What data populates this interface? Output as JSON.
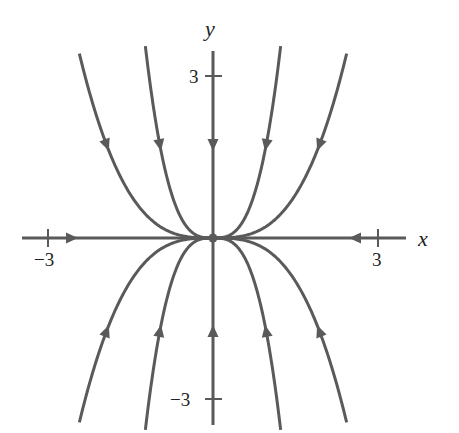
{
  "chart_data": {
    "type": "line",
    "title": "",
    "subtitle": "Phase portrait: trajectories approaching the origin (stable node)",
    "xlabel": "x",
    "ylabel": "y",
    "xlim": [
      -3.8,
      3.5
    ],
    "ylim": [
      -3.45,
      3.46
    ],
    "grid": false,
    "legend": null,
    "x_ticks": [
      {
        "value": -3,
        "label": "−3"
      },
      {
        "value": 3,
        "label": "3"
      }
    ],
    "y_ticks": [
      {
        "value": 3,
        "label": "3"
      },
      {
        "value": -3,
        "label": "−3"
      }
    ],
    "equilibrium": {
      "x": 0,
      "y": 0,
      "label": "origin",
      "kind": "stable node"
    },
    "curve_family": "y = C x^3",
    "series": [
      {
        "name": "curve C=0.238 (upper-right)",
        "C": 0.238,
        "x_range": [
          0,
          2.43
        ],
        "direction": "toward origin"
      },
      {
        "name": "curve C=1.91 (upper-right inner)",
        "C": 1.91,
        "x_range": [
          0,
          1.23
        ],
        "direction": "toward origin"
      },
      {
        "name": "curve C=-0.238 (upper-left)",
        "C": -0.238,
        "x_range": [
          -2.43,
          0
        ],
        "direction": "toward origin"
      },
      {
        "name": "curve C=-1.91 (upper-left inner)",
        "C": -1.91,
        "x_range": [
          -1.23,
          0
        ],
        "direction": "toward origin"
      },
      {
        "name": "curve C=0.238 (lower-left)",
        "C": 0.238,
        "x_range": [
          -2.43,
          0
        ],
        "direction": "toward origin"
      },
      {
        "name": "curve C=1.91 (lower-left inner)",
        "C": 1.91,
        "x_range": [
          -1.23,
          0
        ],
        "direction": "toward origin"
      },
      {
        "name": "curve C=-0.238 (lower-right)",
        "C": -0.238,
        "x_range": [
          0,
          2.43
        ],
        "direction": "toward origin"
      },
      {
        "name": "curve C=-1.91 (lower-right inner)",
        "C": -1.91,
        "x_range": [
          0,
          1.23
        ],
        "direction": "toward origin"
      },
      {
        "name": "positive y-axis trajectory",
        "x": 0,
        "y_range": [
          0,
          3.46
        ],
        "direction": "toward origin"
      },
      {
        "name": "negative y-axis trajectory",
        "x": 0,
        "y_range": [
          -3.45,
          0
        ],
        "direction": "toward origin"
      },
      {
        "name": "negative x-axis trajectory",
        "y": 0,
        "x_range": [
          -3.8,
          0
        ],
        "direction": "toward origin"
      },
      {
        "name": "positive x-axis trajectory",
        "y": 0,
        "x_range": [
          0,
          3.5
        ],
        "direction": "toward origin"
      }
    ],
    "style": {
      "line_color": "#5a5a5a",
      "text_color": "#222222",
      "background": "#ffffff"
    }
  },
  "labels": {
    "x_axis": "x",
    "y_axis": "y",
    "x_tick_neg": "−3",
    "x_tick_pos": "3",
    "y_tick_pos": "3",
    "y_tick_neg": "−3"
  }
}
